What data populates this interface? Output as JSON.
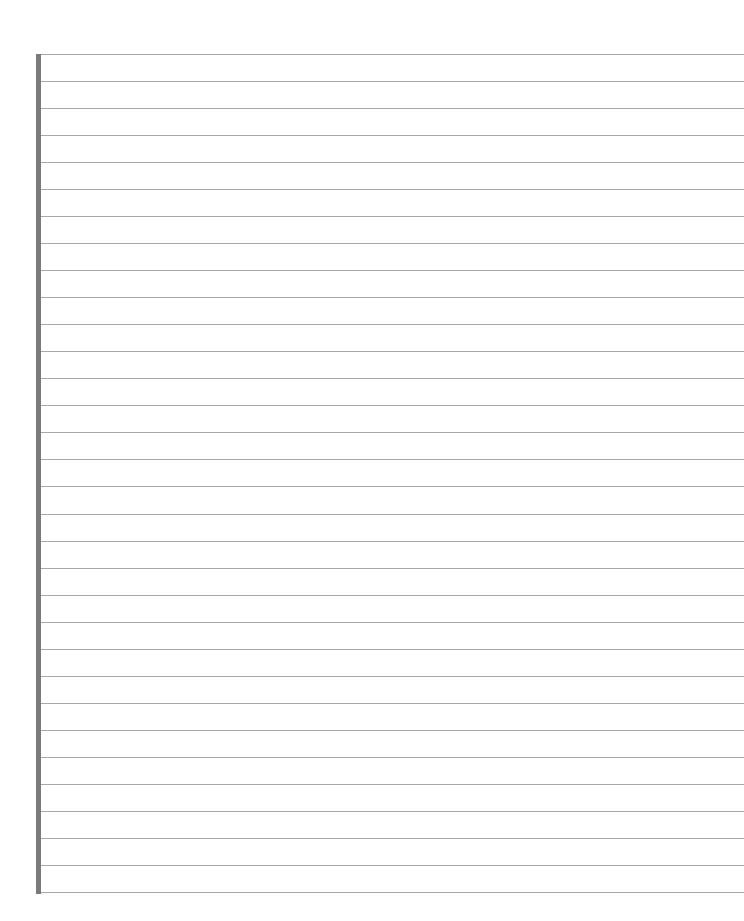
{
  "page": {
    "type": "lined-paper",
    "background": "#ffffff",
    "margin_bar_color": "#7a7a7a",
    "rule_color": "#a8a8a8",
    "line_count": 32,
    "line_spacing_px": 27.03
  }
}
